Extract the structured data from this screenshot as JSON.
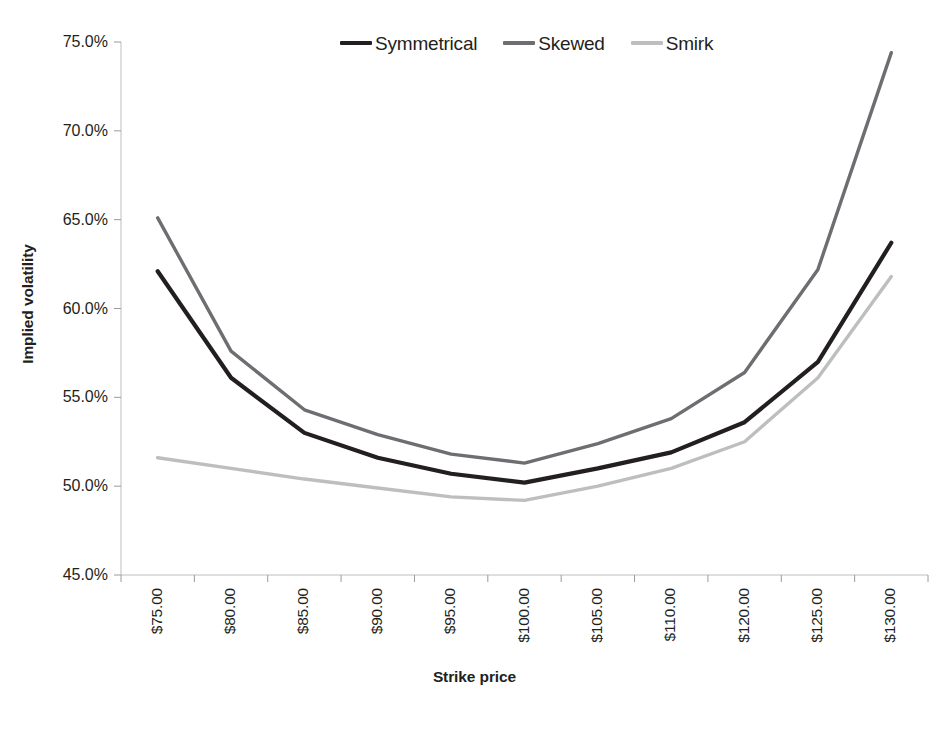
{
  "chart_data": {
    "type": "line",
    "title": "",
    "xlabel": "Strike price",
    "ylabel": "Implied volatility",
    "categories": [
      "$75.00",
      "$80.00",
      "$85.00",
      "$90.00",
      "$95.00",
      "$100.00",
      "$105.00",
      "$110.00",
      "$120.00",
      "$125.00",
      "$130.00"
    ],
    "ylim": [
      45.0,
      75.0
    ],
    "ytick_labels": [
      "75.0%",
      "70.0%",
      "65.0%",
      "60.0%",
      "55.0%",
      "50.0%",
      "45.0%"
    ],
    "ytick_values": [
      75.0,
      70.0,
      65.0,
      60.0,
      55.0,
      50.0,
      45.0
    ],
    "grid": false,
    "legend_position": "top",
    "series": [
      {
        "name": "Symmetrical",
        "color": "#231f20",
        "values": [
          62.1,
          56.1,
          53.0,
          51.6,
          50.7,
          50.2,
          51.0,
          51.9,
          53.6,
          57.0,
          63.7
        ]
      },
      {
        "name": "Skewed",
        "color": "#6d6e71",
        "values": [
          65.1,
          57.6,
          54.3,
          52.9,
          51.8,
          51.3,
          52.4,
          53.8,
          56.4,
          62.2,
          74.4
        ]
      },
      {
        "name": "Smirk",
        "color": "#bcbec0",
        "values": [
          51.6,
          51.0,
          50.4,
          49.9,
          49.4,
          49.2,
          50.0,
          51.0,
          52.5,
          56.1,
          61.8
        ]
      }
    ]
  }
}
